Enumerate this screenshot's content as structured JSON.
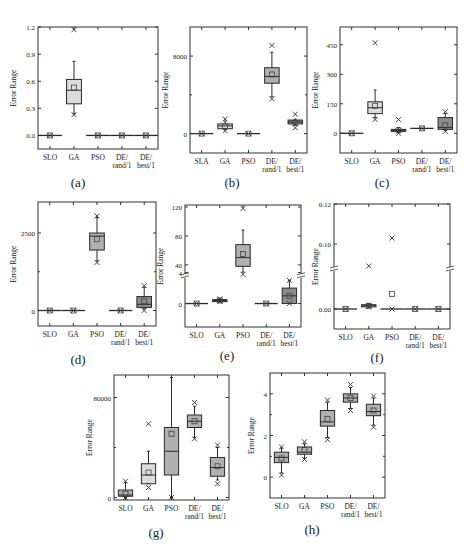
{
  "figure": {
    "colors": {
      "frame": "#333333",
      "light_box": "#dcdcdc",
      "mid_box": "#b0b0b0",
      "dark_box": "#8c8c8c",
      "line": "#2a2a2a"
    }
  },
  "chart_data": [
    {
      "id": "a",
      "caption": "(a)",
      "type": "box",
      "ylabel": "Error Range",
      "categories": [
        "SLO",
        "GA",
        "PSO",
        "DE/\nrand/1",
        "DE/\nbest/1"
      ],
      "yticks": [
        0.0,
        0.3,
        0.6,
        0.9,
        1.2
      ],
      "ytick_labels": [
        "0.0",
        "0.3",
        "0.6",
        "0.9",
        "1.2"
      ],
      "ylim": [
        -0.15,
        1.2
      ],
      "boxes": [
        {
          "min": 0,
          "q1": 0,
          "median": 0,
          "q3": 0,
          "max": 0,
          "mean": 0,
          "outliers": [
            0
          ],
          "shade": "flat"
        },
        {
          "min": 0.24,
          "q1": 0.35,
          "median": 0.5,
          "q3": 0.62,
          "max": 0.82,
          "mean": 0.53,
          "outliers": [
            0.23,
            1.17
          ],
          "shade": "light"
        },
        {
          "min": 0,
          "q1": 0,
          "median": 0,
          "q3": 0,
          "max": 0,
          "mean": 0,
          "outliers": [
            0
          ],
          "shade": "flat"
        },
        {
          "min": 0,
          "q1": 0,
          "median": 0,
          "q3": 0,
          "max": 0,
          "mean": 0,
          "outliers": [
            0
          ],
          "shade": "flat"
        },
        {
          "min": 0,
          "q1": 0,
          "median": 0,
          "q3": 0,
          "max": 0,
          "mean": 0,
          "outliers": [
            0
          ],
          "shade": "flat"
        }
      ]
    },
    {
      "id": "b",
      "caption": "(b)",
      "type": "box",
      "ylabel": "Error Range",
      "categories": [
        "SLA",
        "GA",
        "PSO",
        "DE/\nrand/1",
        "DE/\nbest/1"
      ],
      "yticks": [
        0,
        8000
      ],
      "ytick_labels": [
        "0",
        "8000"
      ],
      "minor_ticks": [
        4000,
        12000
      ],
      "ylim": [
        -2000,
        11000
      ],
      "boxes": [
        {
          "min": 0,
          "q1": 0,
          "median": 0,
          "q3": 0,
          "max": 0,
          "mean": 0,
          "outliers": [
            0
          ],
          "shade": "flat"
        },
        {
          "min": 400,
          "q1": 500,
          "median": 800,
          "q3": 1000,
          "max": 1300,
          "mean": 750,
          "outliers": [
            300,
            1500
          ],
          "shade": "light"
        },
        {
          "min": 0,
          "q1": 0,
          "median": 0,
          "q3": 0,
          "max": 0,
          "mean": 0,
          "outliers": [
            0
          ],
          "shade": "flat"
        },
        {
          "min": 3800,
          "q1": 5200,
          "median": 5900,
          "q3": 6800,
          "max": 8400,
          "mean": 6100,
          "outliers": [
            3600,
            9100
          ],
          "shade": "mid"
        },
        {
          "min": 900,
          "q1": 1000,
          "median": 1200,
          "q3": 1400,
          "max": 1500,
          "mean": 1100,
          "outliers": [
            600,
            2000
          ],
          "shade": "dark"
        }
      ]
    },
    {
      "id": "c",
      "caption": "(c)",
      "type": "box",
      "ylabel": "Error Range",
      "categories": [
        "SLO",
        "GA",
        "PSO",
        "DE/\nrand/1",
        "DE/\nbest/1"
      ],
      "yticks": [
        0,
        150,
        300,
        450
      ],
      "ytick_labels": [
        "0",
        "150",
        "300",
        "450"
      ],
      "ylim": [
        -100,
        540
      ],
      "boxes": [
        {
          "min": 0,
          "q1": 0,
          "median": 0,
          "q3": 0,
          "max": 0,
          "mean": 0,
          "outliers": [
            0
          ],
          "shade": "flat"
        },
        {
          "min": 80,
          "q1": 100,
          "median": 130,
          "q3": 160,
          "max": 220,
          "mean": 140,
          "outliers": [
            70,
            460
          ],
          "shade": "light"
        },
        {
          "min": 5,
          "q1": 10,
          "median": 15,
          "q3": 20,
          "max": 30,
          "mean": 15,
          "outliers": [
            0,
            70
          ],
          "shade": "mid"
        },
        {
          "min": 25,
          "q1": 25,
          "median": 25,
          "q3": 25,
          "max": 25,
          "mean": 25,
          "outliers": [
            25
          ],
          "shade": "flat"
        },
        {
          "min": 15,
          "q1": 20,
          "median": 30,
          "q3": 80,
          "max": 100,
          "mean": 40,
          "outliers": [
            10,
            110
          ],
          "shade": "dark"
        }
      ]
    },
    {
      "id": "d",
      "caption": "(d)",
      "type": "box",
      "ylabel": "Error Range",
      "categories": [
        "SLO",
        "GA",
        "PSO",
        "DE/\nrand/1",
        "DE/\nbest/1"
      ],
      "yticks": [
        0,
        2500
      ],
      "ytick_labels": [
        "0",
        "2500"
      ],
      "minor_ticks": [
        1250,
        3750
      ],
      "ylim": [
        -500,
        3500
      ],
      "boxes": [
        {
          "min": 0,
          "q1": 0,
          "median": 0,
          "q3": 0,
          "max": 0,
          "mean": 0,
          "outliers": [
            0
          ],
          "shade": "flat"
        },
        {
          "min": 0,
          "q1": 0,
          "median": 0,
          "q3": 0,
          "max": 0,
          "mean": 0,
          "outliers": [
            0
          ],
          "shade": "flat"
        },
        {
          "min": 1600,
          "q1": 1950,
          "median": 2400,
          "q3": 2500,
          "max": 3000,
          "mean": 2300,
          "outliers": [
            1550,
            3050
          ],
          "shade": "mid"
        },
        {
          "min": 0,
          "q1": 0,
          "median": 0,
          "q3": 0,
          "max": 0,
          "mean": 0,
          "outliers": [
            0
          ],
          "shade": "flat"
        },
        {
          "min": 50,
          "q1": 100,
          "median": 200,
          "q3": 450,
          "max": 750,
          "mean": 300,
          "outliers": [
            0,
            800
          ],
          "shade": "dark"
        }
      ]
    },
    {
      "id": "e",
      "caption": "(e)",
      "type": "box",
      "ylabel": "Error Range",
      "categories": [
        "SLO",
        "GA",
        "PSO",
        "DE/\nrand/1",
        "DE/\nbest/1"
      ],
      "yticks": [
        0,
        4,
        40,
        80,
        120
      ],
      "ytick_labels": [
        "0",
        "4",
        "40",
        "80",
        "120"
      ],
      "axis_break": true,
      "ylim": [
        -2,
        120
      ],
      "boxes": [
        {
          "min": 0,
          "q1": 0,
          "median": 0,
          "q3": 0,
          "max": 0,
          "mean": 0,
          "outliers": [
            0
          ],
          "shade": "flat"
        },
        {
          "min": 0.2,
          "q1": 0.3,
          "median": 0.4,
          "q3": 0.5,
          "max": 0.6,
          "mean": 0.4,
          "outliers": [
            0.3,
            0.6
          ],
          "shade": "dark"
        },
        {
          "min": 30,
          "q1": 38,
          "median": 50,
          "q3": 68,
          "max": 88,
          "mean": 55,
          "outliers": [
            27,
            118
          ],
          "shade": "mid"
        },
        {
          "min": 0,
          "q1": 0,
          "median": 0,
          "q3": 0,
          "max": 0,
          "mean": 0,
          "outliers": [
            0
          ],
          "shade": "flat"
        },
        {
          "min": 0,
          "q1": 0,
          "median": 1,
          "q3": 2,
          "max": 3,
          "mean": 1,
          "outliers": [
            0,
            3
          ],
          "shade": "dark"
        }
      ]
    },
    {
      "id": "f",
      "caption": "(f)",
      "type": "box",
      "ylabel": "Error Range",
      "categories": [
        "SLO",
        "GA",
        "PSO",
        "DE/\nrand/1",
        "DE/\nbest/1"
      ],
      "yticks": [
        0.0,
        0.1,
        0.12
      ],
      "ytick_labels": [
        "0.00",
        "0.10",
        "0.12"
      ],
      "axis_break": true,
      "ylim": [
        -0.01,
        0.12
      ],
      "boxes": [
        {
          "min": 0,
          "q1": 0,
          "median": 0,
          "q3": 0,
          "max": 0,
          "mean": 0,
          "outliers": [
            0
          ],
          "shade": "flat"
        },
        {
          "min": 0.002,
          "q1": 0.002,
          "median": 0.003,
          "q3": 0.004,
          "max": 0.005,
          "mean": 0.003,
          "outliers": [
            0.002,
            0.04
          ],
          "shade": "light"
        },
        {
          "min": 0,
          "q1": 0,
          "median": 0,
          "q3": 0,
          "max": 0,
          "mean": 0.014,
          "outliers": [
            0,
            0.103
          ],
          "shade": "flat"
        },
        {
          "min": 0,
          "q1": 0,
          "median": 0,
          "q3": 0,
          "max": 0,
          "mean": 0,
          "outliers": [
            0
          ],
          "shade": "flat"
        },
        {
          "min": 0,
          "q1": 0,
          "median": 0,
          "q3": 0,
          "max": 0,
          "mean": 0,
          "outliers": [
            0
          ],
          "shade": "flat"
        }
      ]
    },
    {
      "id": "g",
      "caption": "(g)",
      "type": "box",
      "ylabel": "Error Range",
      "categories": [
        "SLO",
        "GA",
        "PSO",
        "DE/\nrand/1",
        "DE/\nbest/1"
      ],
      "yticks": [
        0,
        80000
      ],
      "ytick_labels": [
        "0",
        "80000"
      ],
      "minor_ticks": [
        40000
      ],
      "ylim": [
        -2000,
        98000
      ],
      "boxes": [
        {
          "min": 0,
          "q1": 1000,
          "median": 2000,
          "q3": 6000,
          "max": 12000,
          "mean": 3000,
          "outliers": [
            0,
            13000
          ],
          "shade": "mid"
        },
        {
          "min": 11000,
          "q1": 11000,
          "median": 18000,
          "q3": 27000,
          "max": 37000,
          "mean": 20000,
          "outliers": [
            8000,
            59000
          ],
          "shade": "light"
        },
        {
          "min": 0,
          "q1": 18000,
          "median": 37000,
          "q3": 56000,
          "max": 96000,
          "mean": 51000,
          "outliers": [
            0
          ],
          "shade": "mid"
        },
        {
          "min": 48000,
          "q1": 56000,
          "median": 61000,
          "q3": 66000,
          "max": 73000,
          "mean": 61000,
          "outliers": [
            47000,
            76000
          ],
          "shade": "mid"
        },
        {
          "min": 14000,
          "q1": 17000,
          "median": 24000,
          "q3": 32000,
          "max": 40000,
          "mean": 25000,
          "outliers": [
            11000,
            42000
          ],
          "shade": "mid"
        }
      ]
    },
    {
      "id": "h",
      "caption": "(h)",
      "type": "box",
      "ylabel": "Error Range",
      "categories": [
        "SLO",
        "GA",
        "PSO",
        "DE/\nrand/1",
        "DE/\nbest/1"
      ],
      "yticks": [
        0,
        2,
        4
      ],
      "ytick_labels": [
        "0",
        "2",
        "4"
      ],
      "minor_ticks": [
        1,
        3
      ],
      "ylim": [
        -1,
        5
      ],
      "boxes": [
        {
          "min": 0.2,
          "q1": 0.7,
          "median": 0.95,
          "q3": 1.2,
          "max": 1.4,
          "mean": 0.9,
          "outliers": [
            0.1,
            1.45
          ],
          "shade": "mid"
        },
        {
          "min": 0.9,
          "q1": 1.1,
          "median": 1.2,
          "q3": 1.45,
          "max": 1.6,
          "mean": 1.3,
          "outliers": [
            0.85,
            1.7
          ],
          "shade": "mid"
        },
        {
          "min": 1.9,
          "q1": 2.45,
          "median": 2.65,
          "q3": 3.2,
          "max": 3.6,
          "mean": 2.8,
          "outliers": [
            1.8,
            3.7
          ],
          "shade": "mid"
        },
        {
          "min": 3.3,
          "q1": 3.6,
          "median": 3.8,
          "q3": 4.0,
          "max": 4.3,
          "mean": 3.8,
          "outliers": [
            3.2,
            4.45
          ],
          "shade": "mid"
        },
        {
          "min": 2.5,
          "q1": 2.95,
          "median": 3.15,
          "q3": 3.5,
          "max": 3.8,
          "mean": 3.2,
          "outliers": [
            2.4,
            3.9
          ],
          "shade": "mid"
        }
      ]
    }
  ]
}
